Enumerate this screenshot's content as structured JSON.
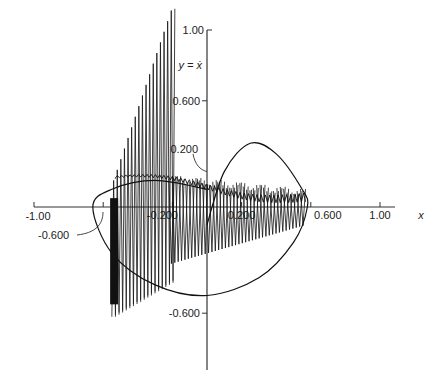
{
  "chart_data": {
    "type": "line",
    "title": "",
    "xlabel": "x",
    "ylabel": "y = ẋ",
    "xlim": [
      -1.0,
      1.2
    ],
    "ylim": [
      -0.9,
      1.1
    ],
    "grid": false,
    "legend": null,
    "x_ticks": [
      {
        "value": -1.0,
        "label": "-1.00"
      },
      {
        "value": -0.6,
        "label": "-0.600"
      },
      {
        "value": -0.2,
        "label": "-0.200"
      },
      {
        "value": 0.2,
        "label": "0.200"
      },
      {
        "value": 0.6,
        "label": "0.600"
      },
      {
        "value": 1.0,
        "label": "1.00"
      }
    ],
    "y_ticks": [
      {
        "value": 1.0,
        "label": "1.00"
      },
      {
        "value": 0.6,
        "label": "0.600"
      },
      {
        "value": 0.2,
        "label": "0.200"
      },
      {
        "value": -0.6,
        "label": "-0.600"
      }
    ],
    "annotations": [
      {
        "text": "0.200",
        "points_to": "y = 0.2 on y-axis"
      },
      {
        "text": "-0.600",
        "points_to": "x = -0.6 on x-axis"
      },
      {
        "text": "-0.200",
        "points_to": "x = -0.2 on x-axis"
      }
    ],
    "series": [
      {
        "name": "limit cycle (closed orbit)",
        "style": "smooth closed curve",
        "x": [
          0.0,
          0.1,
          0.25,
          0.4,
          0.55,
          0.58,
          0.5,
          0.3,
          0.0,
          -0.3,
          -0.55,
          -0.66,
          -0.55,
          -0.3,
          0.0
        ],
        "y": [
          -0.1,
          0.2,
          0.36,
          0.3,
          0.1,
          0.0,
          -0.2,
          -0.4,
          -0.5,
          -0.44,
          -0.26,
          0.0,
          0.1,
          0.15,
          0.1
        ]
      },
      {
        "name": "trajectory (oscillating)",
        "style": "high-frequency oscillation converging",
        "x_range": [
          -0.55,
          0.56
        ],
        "y_envelope_upper": [
          1.0,
          0.2,
          0.1,
          0.05
        ],
        "y_envelope_lower": [
          -0.6,
          -0.3,
          -0.25,
          -0.05
        ]
      }
    ]
  },
  "labels": {
    "x_axis": "x",
    "y_axis": "y = ẋ"
  }
}
